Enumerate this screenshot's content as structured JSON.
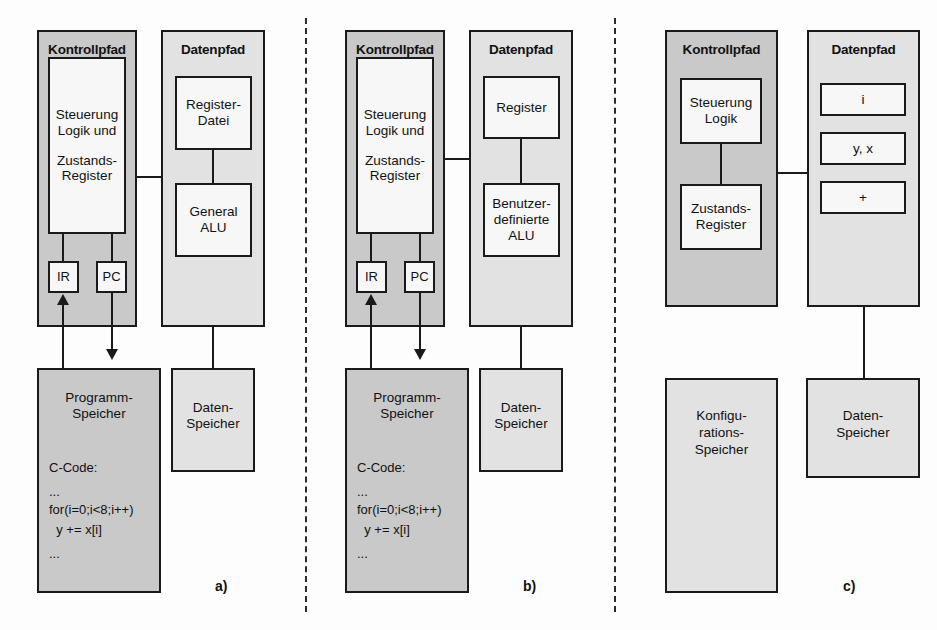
{
  "figure": {
    "kind": "architecture-comparison-diagram",
    "language": "de",
    "background_color": "#fdfdfd",
    "line_color": "#1a1a1a",
    "control_path_fill": "#c9c9c9",
    "data_path_fill": "#e2e2e2",
    "inner_box_fill": "#f7f7f7"
  },
  "panels": [
    {
      "id": "a",
      "caption": "a)",
      "control_path": {
        "title": "Kontrollpfad",
        "logic_box": "Steuerung\nLogik und\n\nZustands-\nRegister",
        "logic_lines": [
          "Steuerung",
          "Logik und",
          "",
          "Zustands-",
          "Register"
        ],
        "registers": [
          {
            "name": "IR"
          },
          {
            "name": "PC"
          }
        ]
      },
      "data_path": {
        "title": "Datenpfad",
        "boxes": [
          {
            "label": "Register-\nDatei",
            "lines": [
              "Register-",
              "Datei"
            ]
          },
          {
            "label": "General\nALU",
            "lines": [
              "General",
              "ALU"
            ]
          }
        ]
      },
      "program_memory": {
        "title_lines": [
          "Programm-",
          "Speicher"
        ],
        "code_heading": "C-Code:",
        "code_lines": [
          "...",
          "for(i=0;i<8;i++)",
          "  y += x[i]",
          "..."
        ]
      },
      "data_memory": {
        "title_lines": [
          "Daten-",
          "Speicher"
        ]
      }
    },
    {
      "id": "b",
      "caption": "b)",
      "control_path": {
        "title": "Kontrollpfad",
        "logic_lines": [
          "Steuerung",
          "Logik und",
          "",
          "Zustands-",
          "Register"
        ],
        "registers": [
          {
            "name": "IR"
          },
          {
            "name": "PC"
          }
        ]
      },
      "data_path": {
        "title": "Datenpfad",
        "boxes": [
          {
            "label": "Register",
            "lines": [
              "Register"
            ]
          },
          {
            "label": "Benutzer-\ndefinierte\nALU",
            "lines": [
              "Benutzer-",
              "definierte",
              "ALU"
            ]
          }
        ]
      },
      "program_memory": {
        "title_lines": [
          "Programm-",
          "Speicher"
        ],
        "code_heading": "C-Code:",
        "code_lines": [
          "...",
          "for(i=0;i<8;i++)",
          "  y += x[i]",
          "..."
        ]
      },
      "data_memory": {
        "title_lines": [
          "Daten-",
          "Speicher"
        ]
      }
    },
    {
      "id": "c",
      "caption": "c)",
      "control_path": {
        "title": "Kontrollpfad",
        "boxes": [
          {
            "label": "Steuerung\nLogik",
            "lines": [
              "Steuerung",
              "Logik"
            ]
          },
          {
            "label": "Zustands-\nRegister",
            "lines": [
              "Zustands-",
              "Register"
            ]
          }
        ]
      },
      "data_path": {
        "title": "Datenpfad",
        "boxes": [
          {
            "label": "i",
            "lines": [
              "i"
            ]
          },
          {
            "label": "y, x",
            "lines": [
              "y, x"
            ]
          },
          {
            "label": "+",
            "lines": [
              "+"
            ]
          }
        ]
      },
      "config_memory": {
        "title_lines": [
          "Konfigu-",
          "rations-",
          "Speicher"
        ]
      },
      "data_memory": {
        "title_lines": [
          "Daten-",
          "Speicher"
        ]
      }
    }
  ]
}
